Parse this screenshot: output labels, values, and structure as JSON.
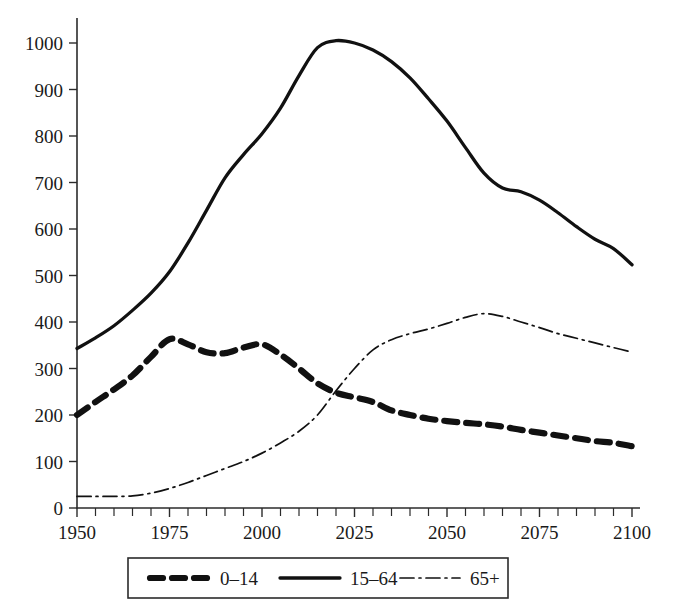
{
  "chart_data": {
    "type": "line",
    "title": "",
    "xlabel": "",
    "ylabel": "",
    "xlim": [
      1950,
      2100
    ],
    "ylim": [
      0,
      1050
    ],
    "grid": false,
    "legend_position": "bottom",
    "x_ticks": [
      1950,
      1975,
      2000,
      2025,
      2050,
      2075,
      2100
    ],
    "x_tick_labels": [
      "1950",
      "1975",
      "2000",
      "2025",
      "2050",
      "2075",
      "2100"
    ],
    "x_minor_tick_step": 5,
    "y_ticks": [
      0,
      100,
      200,
      300,
      400,
      500,
      600,
      700,
      800,
      900,
      1000
    ],
    "y_tick_labels": [
      "0",
      "100",
      "200",
      "300",
      "400",
      "500",
      "600",
      "700",
      "800",
      "900",
      "1000"
    ],
    "x": [
      1950,
      1955,
      1960,
      1965,
      1970,
      1975,
      1980,
      1985,
      1990,
      1995,
      2000,
      2005,
      2010,
      2015,
      2020,
      2025,
      2030,
      2035,
      2040,
      2045,
      2050,
      2055,
      2060,
      2065,
      2070,
      2075,
      2080,
      2085,
      2090,
      2095,
      2100
    ],
    "series": [
      {
        "name": "0-14",
        "style": "dashed-thick",
        "color": "#111111",
        "values": [
          200,
          228,
          255,
          285,
          325,
          363,
          352,
          335,
          333,
          345,
          352,
          330,
          300,
          268,
          248,
          238,
          228,
          210,
          200,
          192,
          187,
          183,
          180,
          175,
          168,
          162,
          156,
          150,
          144,
          140,
          133
        ]
      },
      {
        "name": "15-64",
        "style": "solid",
        "color": "#111111",
        "values": [
          343,
          366,
          392,
          425,
          462,
          508,
          570,
          640,
          710,
          760,
          805,
          860,
          930,
          990,
          1005,
          1000,
          985,
          960,
          925,
          880,
          832,
          775,
          720,
          688,
          680,
          662,
          635,
          605,
          578,
          558,
          523
        ]
      },
      {
        "name": "65+",
        "style": "dash-dot-thin",
        "color": "#111111",
        "values": [
          25,
          25,
          25,
          26,
          32,
          42,
          55,
          70,
          85,
          100,
          118,
          140,
          165,
          200,
          252,
          300,
          340,
          362,
          375,
          385,
          397,
          410,
          418,
          412,
          400,
          388,
          375,
          365,
          355,
          345,
          335
        ]
      }
    ],
    "legend": [
      {
        "label": "0–14",
        "style": "dashed-thick"
      },
      {
        "label": "15–64",
        "style": "solid"
      },
      {
        "label": "65+",
        "style": "dash-dot-thin"
      }
    ]
  }
}
